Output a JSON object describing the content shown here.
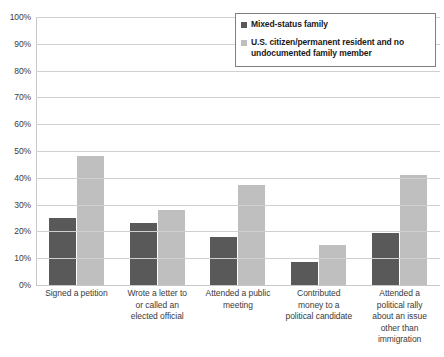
{
  "chart_data": {
    "type": "bar",
    "title": "",
    "subtitle": "",
    "xlabel": "",
    "ylabel": "",
    "ylim": [
      0,
      100
    ],
    "y_tick_labels": [
      "100%",
      "90%",
      "80%",
      "70%",
      "60%",
      "50%",
      "40%",
      "30%",
      "20%",
      "10%",
      "0%"
    ],
    "y_tick_values": [
      100,
      90,
      80,
      70,
      60,
      50,
      40,
      30,
      20,
      10,
      0
    ],
    "grid": true,
    "grid_axis": "y",
    "legend_position": "top-right",
    "categories": [
      "Signed a petition",
      "Wrote a letter to or called an elected official",
      "Attended a public meeting",
      "Contributed money to a political candidate",
      "Attended a political rally about an issue other than immigration"
    ],
    "category_lines": [
      [
        "Signed a petition"
      ],
      [
        "Wrote a letter to",
        "or called an",
        "elected official"
      ],
      [
        "Attended a public",
        "meeting"
      ],
      [
        "Contributed",
        "money to a",
        "political candidate"
      ],
      [
        "Attended a",
        "political rally",
        "about an issue",
        "other than",
        "immigration"
      ]
    ],
    "series": [
      {
        "name": "Mixed-status family",
        "color": "#595959",
        "values": [
          25,
          23,
          18,
          8.5,
          19.5
        ]
      },
      {
        "name": "U.S. citizen/permanent resident and no undocumented family member",
        "color": "#bfbfbf",
        "values": [
          48,
          28,
          37.5,
          15,
          41
        ]
      }
    ]
  },
  "legend": {
    "entries": [
      {
        "label": "Mixed-status family"
      },
      {
        "label": "U.S. citizen/permanent resident and no undocumented family member"
      }
    ],
    "entry_lines": [
      [
        "Mixed-status family"
      ],
      [
        "U.S. citizen/permanent resident and no",
        "undocumented family member"
      ]
    ]
  },
  "colors": {
    "series_a": "#595959",
    "series_b": "#bfbfbf",
    "gridline": "#d0d0d0",
    "axis": "#c8c8c8",
    "text": "#3a3a3a",
    "legend_border": "#7f7f7f",
    "background": "#ffffff"
  }
}
